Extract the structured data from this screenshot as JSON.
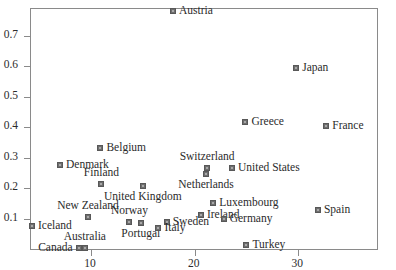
{
  "chart_data": {
    "type": "scatter",
    "title": "",
    "subtitle": "",
    "xlabel": "",
    "ylabel": "",
    "xlim": [
      4.2,
      37.6
    ],
    "ylim": [
      0.0,
      0.787
    ],
    "xticks": [
      10,
      20,
      30
    ],
    "xticklabels": [
      "10",
      "20",
      "30"
    ],
    "yticks": [
      0.1,
      0.2,
      0.3,
      0.4,
      0.5,
      0.6,
      0.7
    ],
    "yticklabels": [
      "0.1",
      "0.2",
      "0.3",
      "0.4",
      "0.5",
      "0.6",
      "0.7"
    ],
    "grid": false,
    "legend": false,
    "marker": "square",
    "marker_color": "#6e6e6e",
    "points": [
      {
        "label": "Austria",
        "x": 17.9,
        "y": 0.782,
        "pos": "r"
      },
      {
        "label": "Japan",
        "x": 29.8,
        "y": 0.592,
        "pos": "r"
      },
      {
        "label": "Greece",
        "x": 24.9,
        "y": 0.418,
        "pos": "r"
      },
      {
        "label": "France",
        "x": 32.7,
        "y": 0.404,
        "pos": "r"
      },
      {
        "label": "Belgium",
        "x": 10.9,
        "y": 0.332,
        "pos": "r"
      },
      {
        "label": "Denmark",
        "x": 7.0,
        "y": 0.274,
        "pos": "r"
      },
      {
        "label": "Switzerland",
        "x": 21.2,
        "y": 0.266,
        "pos": "a"
      },
      {
        "label": "United States",
        "x": 23.6,
        "y": 0.265,
        "pos": "r"
      },
      {
        "label": "Netherlands",
        "x": 21.1,
        "y": 0.246,
        "pos": "b"
      },
      {
        "label": "Finland",
        "x": 11.0,
        "y": 0.213,
        "pos": "a"
      },
      {
        "label": "United Kingdom",
        "x": 15.0,
        "y": 0.207,
        "pos": "b"
      },
      {
        "label": "Luxembourg",
        "x": 21.8,
        "y": 0.152,
        "pos": "r"
      },
      {
        "label": "Spain",
        "x": 31.9,
        "y": 0.127,
        "pos": "r"
      },
      {
        "label": "Ireland",
        "x": 20.6,
        "y": 0.113,
        "pos": "r"
      },
      {
        "label": "New Zealand",
        "x": 9.7,
        "y": 0.106,
        "pos": "a"
      },
      {
        "label": "Germany",
        "x": 22.8,
        "y": 0.098,
        "pos": "r"
      },
      {
        "label": "Norway",
        "x": 13.7,
        "y": 0.09,
        "pos": "a"
      },
      {
        "label": "Sweden",
        "x": 17.3,
        "y": 0.088,
        "pos": "r"
      },
      {
        "label": "Portugal",
        "x": 14.8,
        "y": 0.085,
        "pos": "b"
      },
      {
        "label": "Iceland",
        "x": 4.3,
        "y": 0.076,
        "pos": "r"
      },
      {
        "label": "Italy",
        "x": 16.5,
        "y": 0.068,
        "pos": "r"
      },
      {
        "label": "Turkey",
        "x": 25.0,
        "y": 0.012,
        "pos": "r"
      },
      {
        "label": "Canada",
        "x": 8.8,
        "y": 0.004,
        "pos": "l"
      },
      {
        "label": "Australia",
        "x": 9.4,
        "y": 0.004,
        "pos": "a"
      }
    ]
  }
}
